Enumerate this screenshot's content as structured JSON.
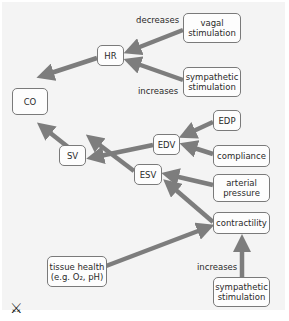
{
  "diagram": {
    "nodes": {
      "co": "CO",
      "hr": "HR",
      "vagal": "vagal stimulation",
      "symp_top": "sympathetic stimulation",
      "edv": "EDV",
      "edp": "EDP",
      "compliance": "compliance",
      "sv": "SV",
      "arterial": "arterial pressure",
      "esv": "ESV",
      "contractility": "contractility",
      "tissue_line1": "tissue health",
      "tissue_line2": "(e.g. O₂, pH)",
      "symp_bottom": "sympathetic stimulation"
    },
    "labels": {
      "decreases": "decreases",
      "increases_top": "increases",
      "increases_bottom": "increases"
    },
    "logo": "⚔",
    "colors": {
      "arrow": "#7d7d7d",
      "panel": "#f4f4f4",
      "border": "#7a7a7a"
    }
  }
}
